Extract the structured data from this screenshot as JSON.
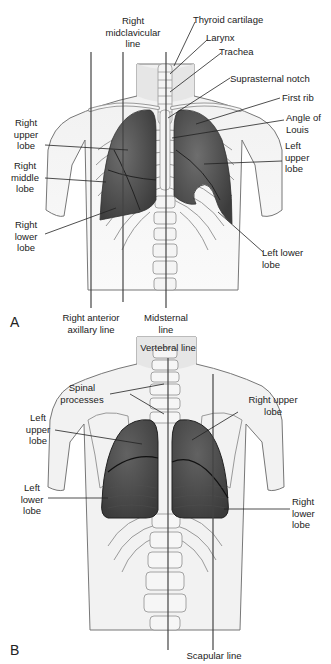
{
  "figure": {
    "panel_a": {
      "letter": "A",
      "view": "anterior",
      "labels": {
        "right_midclavicular_1": "Right",
        "right_midclavicular_2": "midclavicular",
        "right_midclavicular_3": "line",
        "thyroid_cartilage": "Thyroid cartilage",
        "larynx": "Larynx",
        "trachea": "Trachea",
        "suprasternal_notch": "Suprasternal notch",
        "first_rib": "First rib",
        "angle_of_louis_1": "Angle of",
        "angle_of_louis_2": "Louis",
        "left_upper_lobe_1": "Left",
        "left_upper_lobe_2": "upper",
        "left_upper_lobe_3": "lobe",
        "right_upper_lobe_1": "Right",
        "right_upper_lobe_2": "upper",
        "right_upper_lobe_3": "lobe",
        "right_middle_lobe_1": "Right",
        "right_middle_lobe_2": "middle",
        "right_middle_lobe_3": "lobe",
        "right_lower_lobe_1": "Right",
        "right_lower_lobe_2": "lower",
        "right_lower_lobe_3": "lobe",
        "left_lower_lobe_1": "Left lower",
        "left_lower_lobe_2": "lobe",
        "right_anterior_axillary_1": "Right anterior",
        "right_anterior_axillary_2": "axillary line",
        "midsternal_1": "Midsternal",
        "midsternal_2": "line"
      }
    },
    "panel_b": {
      "letter": "B",
      "view": "posterior",
      "labels": {
        "vertebral_line": "Vertebral line",
        "spinal_processes_1": "Spinal",
        "spinal_processes_2": "processes",
        "right_upper_lobe_1": "Right upper",
        "right_upper_lobe_2": "lobe",
        "left_upper_lobe_1": "Left",
        "left_upper_lobe_2": "upper",
        "left_upper_lobe_3": "lobe",
        "left_lower_lobe_1": "Left",
        "left_lower_lobe_2": "lower",
        "left_lower_lobe_3": "lobe",
        "right_lower_lobe_1": "Right",
        "right_lower_lobe_2": "lower",
        "right_lower_lobe_3": "lobe",
        "scapular_line": "Scapular line"
      }
    },
    "colors": {
      "lung_fill": "#4a4a4a",
      "lung_highlight": "#6e6e6e",
      "skin_fill": "#ececec",
      "bone_stroke": "#9a9a9a",
      "outline": "#555555",
      "leader_line": "#222222"
    }
  }
}
